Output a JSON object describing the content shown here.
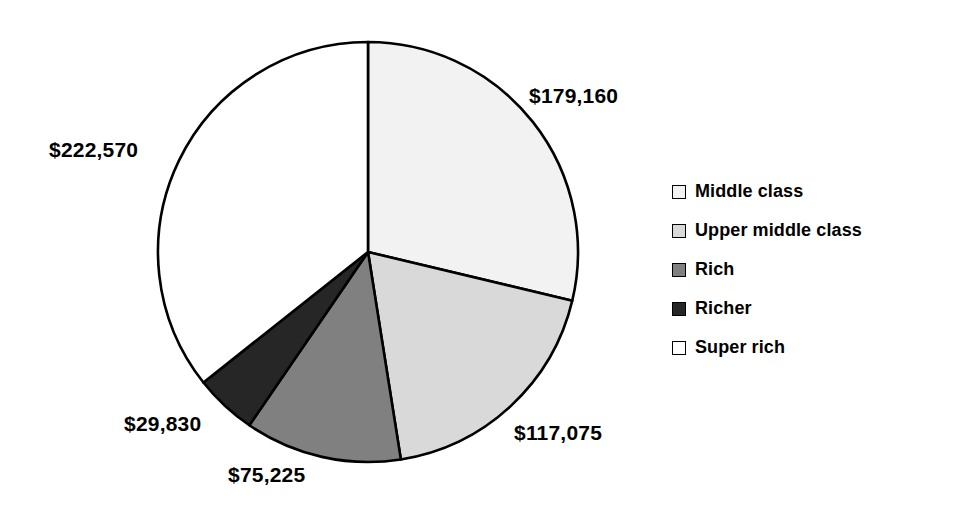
{
  "chart_data": {
    "type": "pie",
    "title": "",
    "subtitle": "",
    "xlabel": "",
    "ylabel": "",
    "grid": false,
    "legend_position": "right",
    "total": 623860,
    "start_angle_deg": 0,
    "direction": "clockwise",
    "categories": [
      "Middle class",
      "Upper middle class",
      "Rich",
      "Richer",
      "Super rich"
    ],
    "values": [
      179160,
      117075,
      75225,
      29830,
      222570
    ],
    "data_labels": [
      "$179,160",
      "$117,075",
      "$75,225",
      "$29,830",
      "$222,570"
    ],
    "colors": [
      "#F2F2F2",
      "#D9D9D9",
      "#808080",
      "#262626",
      "#FFFFFF"
    ],
    "slice_border_color": "#000000",
    "slices": [
      {
        "label": "Middle class",
        "value": 179160,
        "display": "$179,160",
        "color": "#F2F2F2",
        "angle_deg": 103.4,
        "start_deg": 0,
        "end_deg": 103.4
      },
      {
        "label": "Upper middle class",
        "value": 117075,
        "display": "$117,075",
        "color": "#D9D9D9",
        "angle_deg": 67.6,
        "start_deg": 103.4,
        "end_deg": 171.0
      },
      {
        "label": "Rich",
        "value": 75225,
        "display": "$75,225",
        "color": "#808080",
        "angle_deg": 43.4,
        "start_deg": 171.0,
        "end_deg": 214.4
      },
      {
        "label": "Richer",
        "value": 29830,
        "display": "$29,830",
        "color": "#262626",
        "angle_deg": 17.2,
        "start_deg": 214.4,
        "end_deg": 231.6
      },
      {
        "label": "Super rich",
        "value": 222570,
        "display": "$222,570",
        "color": "#FFFFFF",
        "angle_deg": 128.4,
        "start_deg": 231.6,
        "end_deg": 360.0
      }
    ]
  },
  "legend": {
    "items": [
      {
        "label": "Middle class",
        "swatch": "#F2F2F2"
      },
      {
        "label": "Upper middle class",
        "swatch": "#D9D9D9"
      },
      {
        "label": "Rich",
        "swatch": "#808080"
      },
      {
        "label": "Richer",
        "swatch": "#262626"
      },
      {
        "label": "Super rich",
        "swatch": "#FFFFFF"
      }
    ]
  },
  "labels": {
    "middle_class": "$179,160",
    "upper_middle_class": "$117,075",
    "rich": "$75,225",
    "richer": "$29,830",
    "super_rich": "$222,570"
  },
  "geometry": {
    "center_x": 368,
    "center_y": 252,
    "radius": 210
  }
}
